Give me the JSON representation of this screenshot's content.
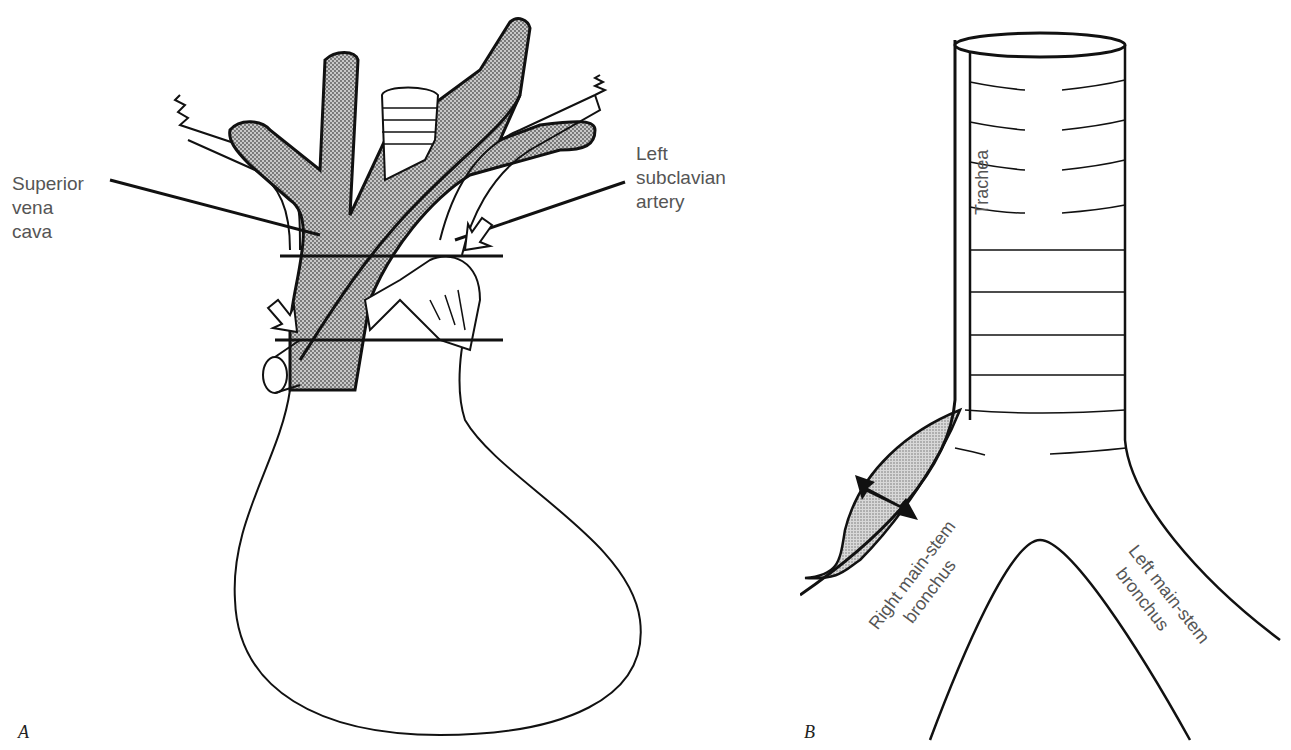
{
  "figure": {
    "panels": [
      {
        "id": "A",
        "letter": "A",
        "labels": {
          "svc": [
            "Superior",
            "vena",
            "cava"
          ],
          "lsa": [
            "Left",
            "subclavian",
            "artery"
          ]
        }
      },
      {
        "id": "B",
        "letter": "B",
        "labels": {
          "trachea": "Trachea",
          "right_bronchus": [
            "Right main-stem",
            "bronchus"
          ],
          "left_bronchus": [
            "Left main-stem",
            "bronchus"
          ]
        }
      }
    ],
    "colors": {
      "line": "#111111",
      "shade": "#9a9a9a",
      "label": "#555555",
      "background": "#ffffff"
    }
  }
}
